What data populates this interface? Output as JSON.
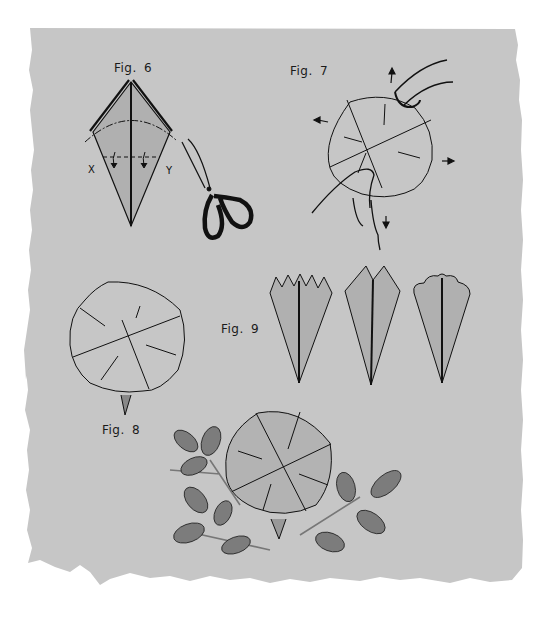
{
  "page": {
    "background_color": "#c6c6c6",
    "paper_fill": "#b3b3b3",
    "ink_color": "#111111"
  },
  "figures": [
    {
      "id": "fig6",
      "label": "Fig. 6",
      "description": "kite-shaped folded paper with dash-dot cutting curve and fold line X–Y, plus scissors",
      "markers": [
        "X",
        "Y"
      ]
    },
    {
      "id": "fig7",
      "label": "Fig. 7",
      "description": "hands spreading folded paper circle with four outward arrows"
    },
    {
      "id": "fig8",
      "label": "Fig. 8",
      "description": "open paper flower circle with stem tip"
    },
    {
      "id": "fig9",
      "label": "Fig. 9",
      "description": "three petal edge variations: zigzag, pointed, scalloped"
    },
    {
      "id": "final",
      "label": "",
      "description": "finished paper flower with leaf sprigs"
    }
  ]
}
